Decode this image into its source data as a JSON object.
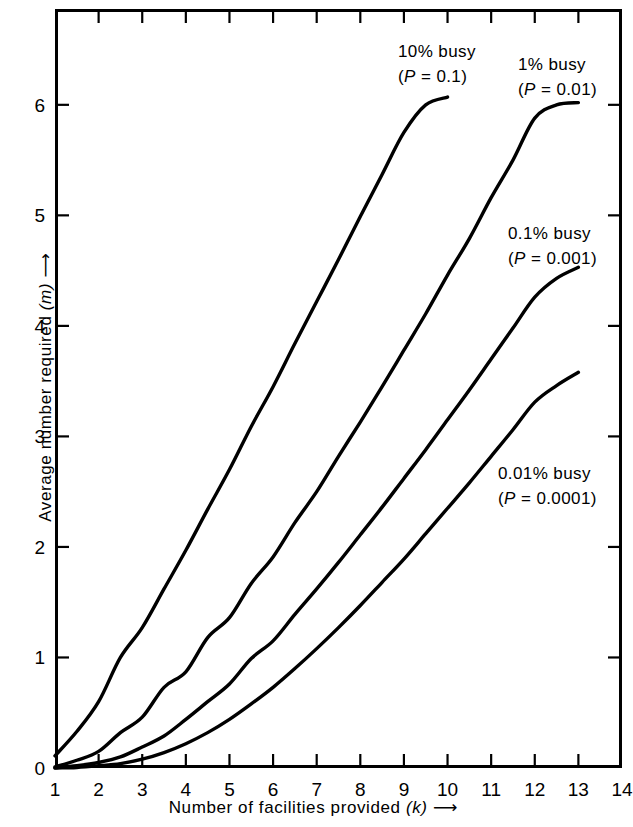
{
  "figure": {
    "background_color": "#ffffff",
    "line_color": "#000000"
  },
  "axes": {
    "x": {
      "title_text": "Number of facilities provided",
      "title_symbol": "(k)",
      "title_arrow": "⟶",
      "ticks": [
        "1",
        "2",
        "3",
        "4",
        "5",
        "6",
        "7",
        "8",
        "9",
        "10",
        "11",
        "12",
        "13",
        "14"
      ],
      "min": 1,
      "max": 14
    },
    "y": {
      "title_text": "Average number required",
      "title_symbol": "(m)",
      "title_arrow": "⟶",
      "ticks": [
        "0",
        "1",
        "2",
        "3",
        "4",
        "5",
        "6"
      ],
      "min": 0,
      "max": 6.867
    }
  },
  "annotations": [
    {
      "id": "busy-10",
      "line1": "10% busy",
      "line2_prefix": "(",
      "line2_symbol": "P",
      "line2_suffix": " = 0.1)",
      "left": 398,
      "top": 40
    },
    {
      "id": "busy-1",
      "line1": "1% busy",
      "line2_prefix": "(",
      "line2_symbol": "P",
      "line2_suffix": " = 0.01)",
      "left": 518,
      "top": 53
    },
    {
      "id": "busy-0p1",
      "line1": "0.1% busy",
      "line2_prefix": "(",
      "line2_symbol": "P",
      "line2_suffix": " = 0.001)",
      "left": 508,
      "top": 222
    },
    {
      "id": "busy-0p01",
      "line1": "0.01% busy",
      "line2_prefix": "(",
      "line2_symbol": "P",
      "line2_suffix": " = 0.0001)",
      "left": 498,
      "top": 462
    }
  ],
  "chart_data": {
    "type": "line",
    "title": "",
    "xlabel": "Number of facilities provided (k)",
    "ylabel": "Average number required (m)",
    "xlim": [
      1,
      14
    ],
    "ylim": [
      0,
      6.867
    ],
    "xticks": [
      1,
      2,
      3,
      4,
      5,
      6,
      7,
      8,
      9,
      10,
      11,
      12,
      13,
      14
    ],
    "yticks": [
      0,
      1,
      2,
      3,
      4,
      5,
      6
    ],
    "grid": false,
    "legend": "inline-annotations",
    "line_color": "#000000",
    "line_width": 3.4,
    "series": [
      {
        "name": "10% busy (P = 0.1)",
        "probability": 0.1,
        "label": "10% busy",
        "x": [
          1,
          1.5,
          2,
          2.5,
          3,
          3.5,
          4,
          4.5,
          5,
          5.5,
          6,
          6.5,
          7,
          7.5,
          8,
          8.5,
          9,
          9.5,
          10
        ],
        "y": [
          0.11,
          0.33,
          0.6,
          1.0,
          1.27,
          1.62,
          1.97,
          2.34,
          2.7,
          3.09,
          3.45,
          3.84,
          4.22,
          4.6,
          4.99,
          5.37,
          5.75,
          6.0,
          6.07
        ]
      },
      {
        "name": "1% busy (P = 0.01)",
        "probability": 0.01,
        "label": "1% busy",
        "x": [
          1,
          1.5,
          2,
          2.5,
          3,
          3.5,
          4,
          4.5,
          5,
          5.5,
          6,
          6.5,
          7,
          7.5,
          8,
          8.5,
          9,
          9.5,
          10,
          10.5,
          11,
          11.5,
          12,
          12.5,
          13
        ],
        "y": [
          0.01,
          0.07,
          0.15,
          0.32,
          0.46,
          0.73,
          0.87,
          1.18,
          1.36,
          1.67,
          1.91,
          2.22,
          2.5,
          2.82,
          3.13,
          3.45,
          3.78,
          4.11,
          4.46,
          4.79,
          5.16,
          5.5,
          5.88,
          6.0,
          6.02
        ]
      },
      {
        "name": "0.1% busy (P = 0.001)",
        "probability": 0.001,
        "label": "0.1% busy",
        "x": [
          1,
          1.5,
          2,
          2.5,
          3,
          3.5,
          4,
          4.5,
          5,
          5.5,
          6,
          6.5,
          7,
          7.5,
          8,
          8.5,
          9,
          9.5,
          10,
          10.5,
          11,
          11.5,
          12,
          12.5,
          13
        ],
        "y": [
          0.001,
          0.02,
          0.05,
          0.1,
          0.19,
          0.29,
          0.44,
          0.6,
          0.76,
          0.99,
          1.15,
          1.39,
          1.62,
          1.86,
          2.11,
          2.36,
          2.62,
          2.88,
          3.15,
          3.42,
          3.7,
          3.98,
          4.26,
          4.43,
          4.53
        ]
      },
      {
        "name": "0.01% busy (P = 0.0001)",
        "probability": 0.0001,
        "label": "0.01% busy",
        "x": [
          1,
          1.5,
          2,
          2.5,
          3,
          3.5,
          4,
          4.5,
          5,
          5.5,
          6,
          6.5,
          7,
          7.5,
          8,
          8.5,
          9,
          9.5,
          10,
          10.5,
          11,
          11.5,
          12,
          12.5,
          13
        ],
        "y": [
          0.0001,
          0.005,
          0.02,
          0.04,
          0.08,
          0.14,
          0.22,
          0.32,
          0.44,
          0.58,
          0.73,
          0.9,
          1.08,
          1.27,
          1.47,
          1.68,
          1.89,
          2.12,
          2.35,
          2.58,
          2.82,
          3.06,
          3.31,
          3.46,
          3.58
        ]
      }
    ]
  }
}
